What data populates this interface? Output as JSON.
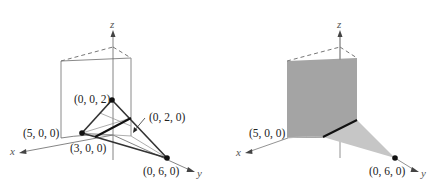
{
  "figures": [
    {
      "id": "left",
      "axes": {
        "x": "x",
        "y": "y",
        "z": "z"
      },
      "points": [
        {
          "label": "(0, 0, 2)",
          "coord": [
            0,
            0,
            2
          ],
          "marked": true
        },
        {
          "label": "(3, 0, 0)",
          "coord": [
            3,
            0,
            0
          ],
          "marked": true
        },
        {
          "label": "(0, 6, 0)",
          "coord": [
            0,
            6,
            0
          ],
          "marked": true
        },
        {
          "label": "(0, 2, 0)",
          "coord": [
            0,
            2,
            0
          ],
          "marked": false,
          "pointer_arrow": true
        },
        {
          "label": "(5, 0, 0)",
          "coord": [
            5,
            0,
            0
          ],
          "marked": false
        }
      ],
      "elements": [
        "vertical plane x=5 (outline)",
        "triangle (3,0,0)-(0,0,2)-(0,6,0)",
        "intersection segment (bold)"
      ]
    },
    {
      "id": "right",
      "axes": {
        "x": "x",
        "y": "y",
        "z": "z"
      },
      "points": [
        {
          "label": "(5, 0, 0)",
          "coord": [
            5,
            0,
            0
          ],
          "marked": false
        },
        {
          "label": "(0, 6, 0)",
          "coord": [
            0,
            6,
            0
          ],
          "marked": true
        }
      ],
      "elements": [
        "vertical plane (shaded dark gray)",
        "region in xy-plane (shaded light gray)",
        "intersection segment (bold)"
      ],
      "colors": {
        "plane": "#a4a4a4",
        "region": "#c6c6c6",
        "line": "#111111"
      }
    }
  ],
  "labels": {
    "left_p002": "(0, 0, 2)",
    "left_p020": "(0, 2, 0)",
    "left_p500": "(5, 0, 0)",
    "left_p300": "(3, 0, 0)",
    "left_p060": "(0, 6, 0)",
    "right_p500": "(5, 0, 0)",
    "right_p060": "(0, 6, 0)",
    "axis_x": "x",
    "axis_y": "y",
    "axis_z": "z"
  }
}
